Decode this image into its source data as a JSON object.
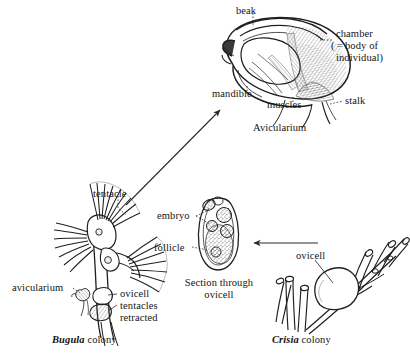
{
  "figure": {
    "ink_color": "#1f1f1f",
    "background": "#ffffff"
  },
  "avicularium_panel": {
    "labels": {
      "beak": "beak",
      "chamber": "chamber\n(=body of\nindividual)",
      "chamber_line1": "chamber",
      "chamber_line2": "( = body of",
      "chamber_line3": "individual)",
      "mandible": "mandible",
      "muscles": "muscles",
      "stalk": "stalk",
      "caption": "Avicularium"
    }
  },
  "bugula_panel": {
    "labels": {
      "tentacle": "tentacle",
      "avicularium": "avicularium",
      "ovicell": "ovicell",
      "tentacles_retracted_line1": "tentacles",
      "tentacles_retracted_line2": "retracted"
    },
    "caption_genus": "Bugula",
    "caption_rest": " colony"
  },
  "ovicell_section_panel": {
    "labels": {
      "embryo": "embryo",
      "follicle": "follicle"
    },
    "caption_line1": "Section through",
    "caption_line2": "ovicell"
  },
  "crisia_panel": {
    "labels": {
      "ovicell": "ovicell"
    },
    "caption_genus": "Crisia",
    "caption_rest": " colony"
  },
  "connectors": {
    "bugula_to_avicularium": "arrow-up-right",
    "crisia_to_section": "arrow-left"
  }
}
